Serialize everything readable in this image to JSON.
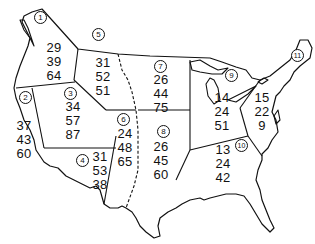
{
  "map": {
    "title": "",
    "line_color": "#111111",
    "regions": [
      {
        "id": "1",
        "values": [
          "29",
          "39",
          "64"
        ]
      },
      {
        "id": "2",
        "values": [
          "37",
          "43",
          "60"
        ]
      },
      {
        "id": "3",
        "values": [
          "34",
          "57",
          "87"
        ]
      },
      {
        "id": "4",
        "values": [
          "31",
          "53",
          "38"
        ]
      },
      {
        "id": "5",
        "values": [
          "31",
          "52",
          "51"
        ]
      },
      {
        "id": "6",
        "values": [
          "24",
          "48",
          "65"
        ]
      },
      {
        "id": "7",
        "values": [
          "26",
          "44",
          "75"
        ]
      },
      {
        "id": "8",
        "values": [
          "26",
          "45",
          "60"
        ]
      },
      {
        "id": "9",
        "values": [
          "14",
          "24",
          "51"
        ]
      },
      {
        "id": "10",
        "values": [
          "13",
          "24",
          "42"
        ]
      },
      {
        "id": "11",
        "values": [
          "15",
          "22",
          "9"
        ]
      }
    ]
  }
}
